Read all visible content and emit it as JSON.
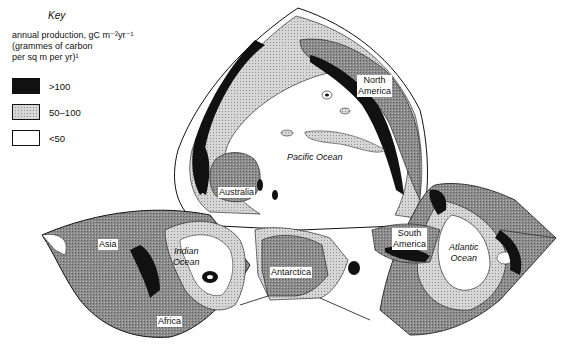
{
  "key": {
    "title": "Key",
    "description_line1": "annual production, gC m⁻²yr⁻¹",
    "description_line2": "(grammes of carbon",
    "description_line3": "per sq m per yr)¹",
    "items": [
      {
        "label": ">100",
        "color": "#111111",
        "pattern": "solid"
      },
      {
        "label": "50–100",
        "color": "#c8c8c8",
        "pattern": "stipple"
      },
      {
        "label": "<50",
        "color": "#ffffff",
        "pattern": "none"
      }
    ]
  },
  "map": {
    "land_color": "#8a8a8a",
    "labels": {
      "north_america": [
        "North",
        "America"
      ],
      "pacific": "Pacific Ocean",
      "australia": "Australia",
      "asia": "Asia",
      "indian": [
        "Indian",
        "Ocean"
      ],
      "africa": "Africa",
      "antarctica": "Antarctica",
      "south_america": [
        "South",
        "America"
      ],
      "atlantic": [
        "Atlantic",
        "Ocean"
      ]
    }
  }
}
